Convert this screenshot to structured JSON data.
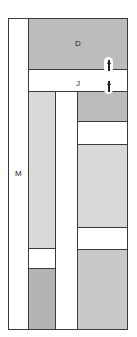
{
  "diagram": {
    "canvas": {
      "width": 137,
      "height": 337,
      "background": "#ffffff"
    },
    "stroke_color": "#3a3a3a",
    "labels": {
      "left_column": "M",
      "top_region": "D",
      "mid_band": "J"
    },
    "fills": {
      "white": "#ffffff",
      "light_gray": "#d9d9d9",
      "mid_gray": "#c9c9c9",
      "dark_gray": "#bcbcbc",
      "deep_gray": "#b4b4b4"
    },
    "regions": [
      {
        "id": "left-column-m",
        "label": "M",
        "fill": "#ffffff",
        "x": 8,
        "y": 18,
        "w": 21,
        "h": 312
      },
      {
        "id": "top-region-d",
        "label": "D",
        "fill": "#bcbcbc",
        "x": 28,
        "y": 18,
        "w": 100,
        "h": 52
      },
      {
        "id": "mid-band-j",
        "label": "J",
        "fill": "#ffffff",
        "x": 28,
        "y": 69,
        "w": 100,
        "h": 23
      },
      {
        "id": "mid-column-upper",
        "label": "",
        "fill": "#d9d9d9",
        "x": 28,
        "y": 91,
        "w": 28,
        "h": 158
      },
      {
        "id": "mid-column-white",
        "label": "",
        "fill": "#ffffff",
        "x": 28,
        "y": 248,
        "w": 28,
        "h": 21
      },
      {
        "id": "mid-column-lower",
        "label": "",
        "fill": "#b4b4b4",
        "x": 28,
        "y": 268,
        "w": 28,
        "h": 62
      },
      {
        "id": "gap-column",
        "label": "",
        "fill": "#ffffff",
        "x": 55,
        "y": 91,
        "w": 23,
        "h": 239
      },
      {
        "id": "right-band-1",
        "label": "",
        "fill": "#bcbcbc",
        "x": 77,
        "y": 91,
        "w": 51,
        "h": 31
      },
      {
        "id": "right-band-2",
        "label": "",
        "fill": "#ffffff",
        "x": 77,
        "y": 121,
        "w": 51,
        "h": 24
      },
      {
        "id": "right-band-3",
        "label": "",
        "fill": "#d9d9d9",
        "x": 77,
        "y": 144,
        "w": 51,
        "h": 84
      },
      {
        "id": "right-band-4",
        "label": "",
        "fill": "#ffffff",
        "x": 77,
        "y": 227,
        "w": 51,
        "h": 23
      },
      {
        "id": "right-band-5",
        "label": "",
        "fill": "#c9c9c9",
        "x": 77,
        "y": 249,
        "w": 51,
        "h": 81
      }
    ],
    "markers": {
      "top_tick": {
        "id": "top-tick-marker",
        "x": 20,
        "y": 10,
        "w": 22,
        "h": 5
      },
      "capsules": [
        {
          "id": "capsule-marker-upper",
          "x": 104,
          "y": 57
        },
        {
          "id": "capsule-marker-lower",
          "x": 104,
          "y": 78
        }
      ]
    }
  }
}
